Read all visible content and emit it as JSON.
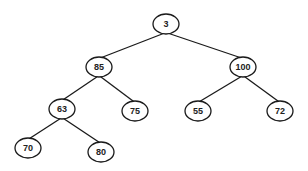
{
  "diagram": {
    "type": "binary-tree",
    "colors": {
      "stroke": "#1a1a1a",
      "fill": "#ffffff",
      "text": "#222222",
      "background": "#ffffff"
    },
    "nodes": [
      {
        "id": "n3",
        "label": "3"
      },
      {
        "id": "n85",
        "label": "85"
      },
      {
        "id": "n100",
        "label": "100"
      },
      {
        "id": "n63",
        "label": "63"
      },
      {
        "id": "n75",
        "label": "75"
      },
      {
        "id": "n55",
        "label": "55"
      },
      {
        "id": "n72",
        "label": "72"
      },
      {
        "id": "n70",
        "label": "70"
      },
      {
        "id": "n80",
        "label": "80"
      }
    ],
    "edges": [
      {
        "from": "n3",
        "to": "n85"
      },
      {
        "from": "n3",
        "to": "n100"
      },
      {
        "from": "n85",
        "to": "n63"
      },
      {
        "from": "n85",
        "to": "n75"
      },
      {
        "from": "n100",
        "to": "n55"
      },
      {
        "from": "n100",
        "to": "n72"
      },
      {
        "from": "n63",
        "to": "n70"
      },
      {
        "from": "n63",
        "to": "n80"
      }
    ]
  }
}
